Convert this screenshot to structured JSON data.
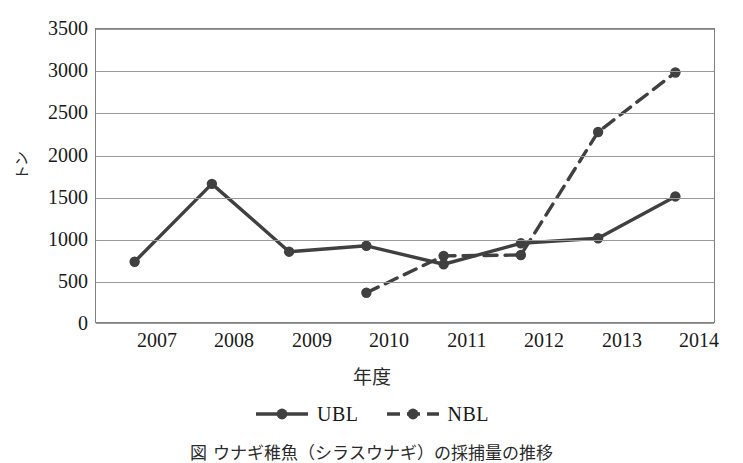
{
  "chart_data": {
    "type": "line",
    "title": "",
    "xlabel": "年度",
    "ylabel": "トン",
    "categories": [
      "2007",
      "2008",
      "2009",
      "2010",
      "2011",
      "2012",
      "2013",
      "2014"
    ],
    "ylim": [
      0,
      3500
    ],
    "ytick_labels": [
      "3500",
      "3000",
      "2500",
      "2000",
      "1500",
      "1000",
      "500",
      "0"
    ],
    "ytick_values": [
      3500,
      3000,
      2500,
      2000,
      1500,
      1000,
      500,
      0
    ],
    "grid": "horizontal",
    "legend_position": "bottom",
    "series": [
      {
        "name": "UBL",
        "style": "solid",
        "marker": "circle",
        "color": "#404040",
        "values": [
          720,
          1650,
          840,
          910,
          690,
          940,
          1000,
          1500
        ]
      },
      {
        "name": "NBL",
        "style": "dashed",
        "marker": "circle",
        "color": "#404040",
        "values": [
          null,
          null,
          null,
          350,
          790,
          800,
          2270,
          2980
        ]
      }
    ]
  },
  "axes": {
    "y_title": "トン",
    "x_title": "年度"
  },
  "legend": {
    "items": [
      {
        "label": "UBL",
        "style": "solid"
      },
      {
        "label": "NBL",
        "style": "dashed"
      }
    ]
  },
  "caption": {
    "text": "図 ウナギ稚魚（シラスウナギ）の採捕量の推移"
  },
  "colors": {
    "line": "#404040",
    "grid": "#9a9a9a",
    "frame": "#808080",
    "text": "#1a1a1a"
  }
}
